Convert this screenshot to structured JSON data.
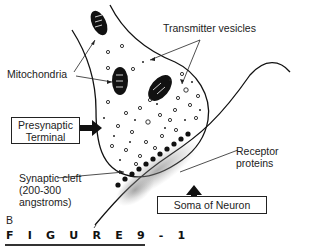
{
  "figure": {
    "caption": "F I G U R E   9 - 1",
    "panel_letter": "B"
  },
  "labels": {
    "transmitter_vesicles": "Transmitter vesicles",
    "mitochondria": "Mitochondria",
    "receptor_proteins_line1": "Receptor",
    "receptor_proteins_line2": "proteins",
    "synaptic_cleft_line1": "Synaptic cleft",
    "synaptic_cleft_line2": "(200-300",
    "synaptic_cleft_line3": "angstroms)"
  },
  "boxes": {
    "presynaptic_line1": "Presynaptic",
    "presynaptic_line2": "Terminal",
    "soma": "Soma of Neuron"
  }
}
